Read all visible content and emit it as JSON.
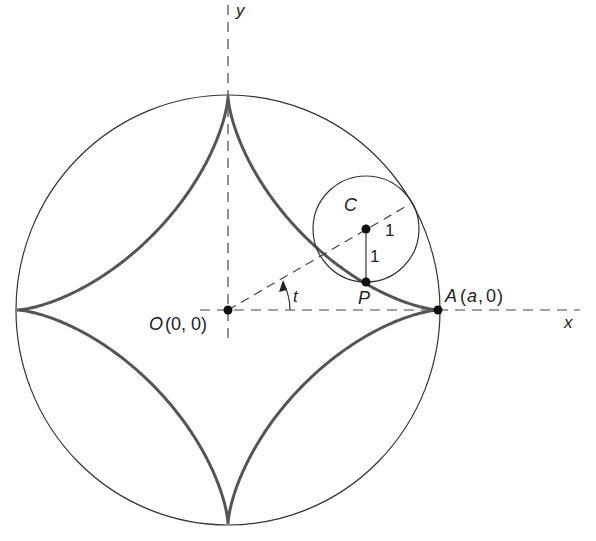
{
  "diagram": {
    "type": "astroid-construction",
    "colors": {
      "curve": "#555555",
      "circle": "#333333",
      "axis": "#444444",
      "text": "#222222",
      "background": "#ffffff"
    },
    "axes": {
      "x_label": "x",
      "y_label": "y"
    },
    "points": {
      "origin": {
        "name": "O",
        "coords": "(0, 0)"
      },
      "A": {
        "name": "A",
        "coords": "(a, 0)",
        "coord_var": "a",
        "coord_zero": "0"
      },
      "P": {
        "name": "P"
      },
      "C": {
        "name": "C"
      }
    },
    "labels": {
      "angle": "t",
      "radius_along_line": "1",
      "radius_vertical": "1"
    },
    "geometry": {
      "outer_circle_radius": "a",
      "rolling_circle_radius": "1",
      "curve": "astroid (four-cusped hypocycloid)",
      "angle_t_degrees": 30
    }
  }
}
